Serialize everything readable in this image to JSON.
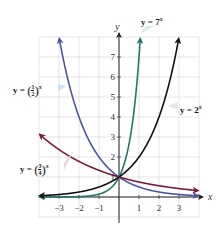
{
  "chart_data": {
    "type": "line",
    "title": "",
    "xlabel": "x",
    "ylabel": "y",
    "xlim": [
      -4,
      4
    ],
    "ylim": [
      -1,
      8
    ],
    "grid": true,
    "x_ticks": [
      -3,
      -2,
      -1,
      1,
      2,
      3
    ],
    "y_ticks": [
      1,
      2,
      3,
      4,
      5,
      6,
      7
    ],
    "x_tick_labels": [
      "−3",
      "−2",
      "−1",
      "1",
      "2",
      "3"
    ],
    "y_tick_labels": [
      "1",
      "2",
      "3",
      "4",
      "5",
      "6",
      "7"
    ],
    "series": [
      {
        "name": "y = (1/2)^x",
        "base": 0.5,
        "color": "#4a55a8",
        "label_prefix": "y = ",
        "label_num": "1",
        "label_den": "2",
        "label_exp": "x",
        "label_bg": "#cfe0ee"
      },
      {
        "name": "y = (3/4)^x",
        "base": 0.75,
        "color": "#7a1a3c",
        "label_prefix": "y = ",
        "label_num": "3",
        "label_den": "4",
        "label_exp": "x",
        "label_bg": "#e6d5de"
      },
      {
        "name": "y = 7^x",
        "base": 7,
        "color": "#1f7a6a",
        "label_prefix": "y = 7",
        "label_exp": "x",
        "label_bg": "#d6ebe2"
      },
      {
        "name": "y = 2^x",
        "base": 2,
        "color": "#111111",
        "label_prefix": "y = 2",
        "label_exp": "x",
        "label_bg": "#e3e6ea"
      }
    ],
    "intersection_point": {
      "x": 0,
      "y": 1
    }
  },
  "colors": {
    "grid": "#d4d4d4",
    "axis": "#222222",
    "tick_text": "#333333"
  }
}
